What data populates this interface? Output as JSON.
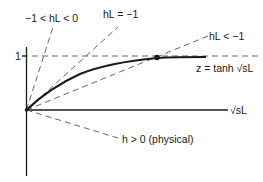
{
  "figure": {
    "type": "diagram",
    "labels": {
      "y_tick_one": "1",
      "x_axis": "√sL",
      "curve": "z = tanh √sL",
      "line_neg1_to_0": "−1 < hL < 0",
      "line_eq_neg1": "hL = −1",
      "line_lt_neg1": "hL < −1",
      "line_h_pos": "h > 0 (physical)"
    },
    "colors": {
      "stroke": "#1a1a1a",
      "dashed": "#555555",
      "background": "#ffffff"
    }
  }
}
